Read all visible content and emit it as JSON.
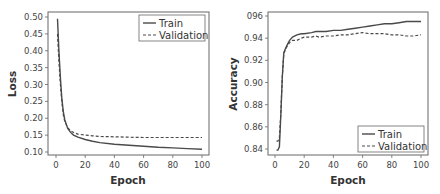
{
  "chart_data": [
    {
      "type": "line",
      "title": "",
      "xlabel": "Epoch",
      "ylabel": "Loss",
      "xlim": [
        0,
        100
      ],
      "ylim": [
        0.1,
        0.5
      ],
      "xticks": [
        "0",
        "20",
        "40",
        "60",
        "80",
        "100"
      ],
      "yticks": [
        "0.10",
        "0.15",
        "0.20",
        "0.25",
        "0.30",
        "0.35",
        "0.40",
        "0.45",
        "0.50"
      ],
      "grid": false,
      "legend_position": "upper right",
      "legend": [
        "Train",
        "Validation"
      ],
      "x": [
        1,
        2,
        3,
        4,
        5,
        6,
        8,
        10,
        12,
        15,
        20,
        25,
        30,
        40,
        50,
        60,
        70,
        80,
        90,
        100
      ],
      "series": [
        {
          "name": "Train",
          "style": "solid",
          "values": [
            0.495,
            0.4,
            0.32,
            0.26,
            0.22,
            0.195,
            0.17,
            0.158,
            0.15,
            0.144,
            0.137,
            0.132,
            0.128,
            0.123,
            0.12,
            0.117,
            0.114,
            0.112,
            0.11,
            0.108
          ]
        },
        {
          "name": "Validation",
          "style": "dashed",
          "values": [
            0.45,
            0.37,
            0.3,
            0.25,
            0.21,
            0.19,
            0.172,
            0.163,
            0.158,
            0.153,
            0.15,
            0.148,
            0.146,
            0.145,
            0.144,
            0.143,
            0.143,
            0.143,
            0.143,
            0.143
          ]
        }
      ]
    },
    {
      "type": "line",
      "title": "",
      "xlabel": "Epoch",
      "ylabel": "Accuracy",
      "xlim": [
        0,
        100
      ],
      "ylim": [
        0.84,
        0.96
      ],
      "xticks": [
        "0",
        "20",
        "40",
        "60",
        "80",
        "100"
      ],
      "yticks": [
        "0.84",
        "0.86",
        "0.88",
        "0.90",
        "0.92",
        "0.94",
        "096"
      ],
      "grid": false,
      "legend_position": "lower right",
      "legend": [
        "Train",
        "Validation"
      ],
      "x": [
        1,
        2,
        3,
        4,
        5,
        6,
        7,
        8,
        10,
        12,
        15,
        18,
        20,
        25,
        28,
        30,
        35,
        40,
        45,
        50,
        55,
        60,
        65,
        70,
        75,
        80,
        85,
        90,
        95,
        100
      ],
      "series": [
        {
          "name": "Train",
          "style": "solid",
          "values": [
            0.839,
            0.839,
            0.842,
            0.87,
            0.905,
            0.927,
            0.93,
            0.933,
            0.938,
            0.941,
            0.943,
            0.944,
            0.944,
            0.945,
            0.946,
            0.946,
            0.946,
            0.947,
            0.947,
            0.948,
            0.949,
            0.95,
            0.951,
            0.952,
            0.953,
            0.953,
            0.954,
            0.955,
            0.955,
            0.955
          ]
        },
        {
          "name": "Validation",
          "style": "dashed",
          "values": [
            0.847,
            0.847,
            0.85,
            0.872,
            0.905,
            0.926,
            0.929,
            0.932,
            0.936,
            0.938,
            0.938,
            0.94,
            0.941,
            0.941,
            0.942,
            0.941,
            0.942,
            0.942,
            0.943,
            0.943,
            0.944,
            0.945,
            0.944,
            0.944,
            0.944,
            0.943,
            0.943,
            0.942,
            0.942,
            0.943
          ]
        }
      ]
    }
  ],
  "charts": [
    {
      "xlabel": "Epoch",
      "ylabel": "Loss",
      "legend_train": "Train",
      "legend_val": "Validation"
    },
    {
      "xlabel": "Epoch",
      "ylabel": "Accuracy",
      "legend_train": "Train",
      "legend_val": "Validation"
    }
  ],
  "colors": {
    "line": "#4a4a4a",
    "frame": "#555555",
    "legend_border": "#555555"
  }
}
